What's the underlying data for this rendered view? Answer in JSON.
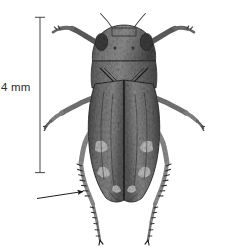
{
  "figure": {
    "kind": "scientific-specimen-photograph",
    "background_color": "#ffffff",
    "ink_color": "#1a1a1a"
  },
  "scale_bar": {
    "label": "4 mm",
    "orientation": "vertical",
    "color": "#4a4a4a",
    "top_y": 17,
    "bottom_y": 173,
    "x": 40,
    "cap_half_width": 5
  },
  "annotation_arrow": {
    "target": "hind-tibia",
    "color": "#111111",
    "tail_x": 37,
    "tail_y": 198,
    "head_x": 85,
    "head_y": 191
  },
  "specimen": {
    "body_fill_dark": "#4e4e4e",
    "body_fill_mid": "#6e6e6e",
    "body_fill_light": "#9a9a9a",
    "outline_color": "#2a2a2a",
    "parts": [
      "antenna-left",
      "antenna-right",
      "head",
      "pronotum",
      "scutellum",
      "forewing-left",
      "forewing-right",
      "foreleg-left",
      "foreleg-right",
      "midleg-left",
      "midleg-right",
      "hindleg-left",
      "hindleg-right"
    ]
  }
}
